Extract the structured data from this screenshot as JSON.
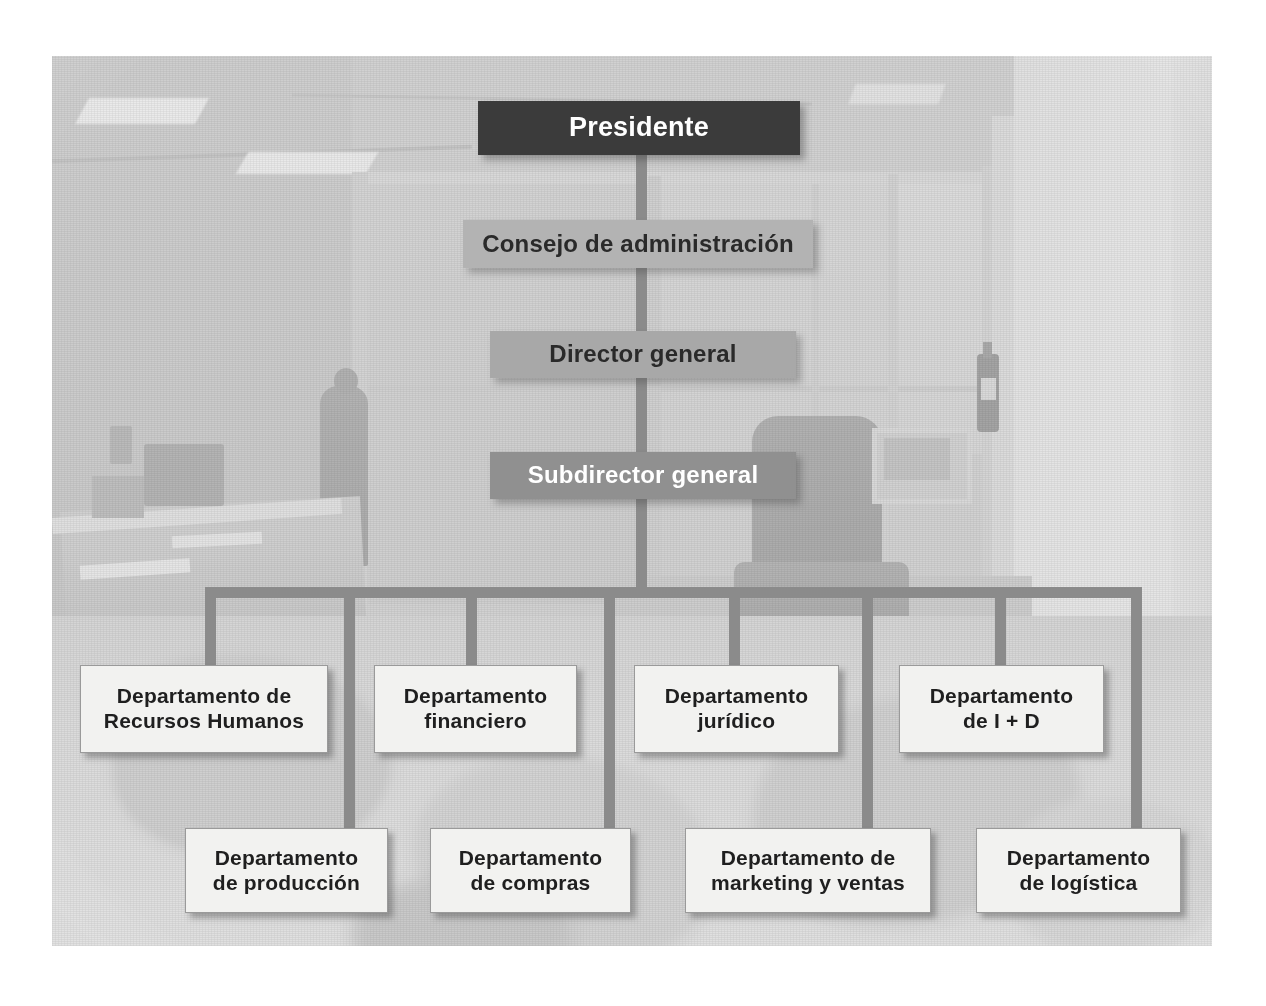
{
  "diagram": {
    "type": "organizational-chart",
    "language": "es",
    "background_scene": "faded grayscale office interior photograph",
    "levels": [
      {
        "level": 1,
        "nodes": [
          {
            "id": "presidente",
            "label": "Presidente",
            "style": "dark",
            "text_color": "#ffffff",
            "box_color": "#3b3b3b"
          }
        ]
      },
      {
        "level": 2,
        "nodes": [
          {
            "id": "consejo",
            "label": "Consejo de administración",
            "style": "gray-light",
            "text_color": "#2a2a2a",
            "box_color": "#b3b3b3"
          }
        ]
      },
      {
        "level": 3,
        "nodes": [
          {
            "id": "director",
            "label": "Director general",
            "style": "gray-medium",
            "text_color": "#2a2a2a",
            "box_color": "#a8a8a8"
          }
        ]
      },
      {
        "level": 4,
        "nodes": [
          {
            "id": "subdirector",
            "label": "Subdirector general",
            "style": "gray-dark",
            "text_color": "#ffffff",
            "box_color": "#909090"
          }
        ]
      },
      {
        "level": 5,
        "label": "departamentos",
        "row_top": [
          {
            "id": "rrhh",
            "line1": "Departamento de",
            "line2": "Recursos Humanos"
          },
          {
            "id": "financiero",
            "line1": "Departamento",
            "line2": "financiero"
          },
          {
            "id": "juridico",
            "line1": "Departamento",
            "line2": "jurídico"
          },
          {
            "id": "id",
            "line1": "Departamento",
            "line2": "de I + D"
          }
        ],
        "row_bottom": [
          {
            "id": "produccion",
            "line1": "Departamento",
            "line2": "de producción"
          },
          {
            "id": "compras",
            "line1": "Departamento",
            "line2": "de compras"
          },
          {
            "id": "marketing",
            "line1": "Departamento de",
            "line2": "marketing y ventas"
          },
          {
            "id": "logistica",
            "line1": "Departamento",
            "line2": "de logística"
          }
        ]
      }
    ],
    "colors": {
      "presidente_box": "#3b3b3b",
      "consejo_box": "#b3b3b3",
      "director_box": "#a8a8a8",
      "subdirector_box": "#909090",
      "departamento_box": "#f2f2f0",
      "connector": "#8b8b8b",
      "page_background": "#ffffff"
    }
  }
}
